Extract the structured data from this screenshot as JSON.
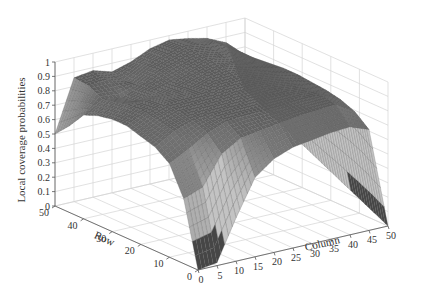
{
  "chart_data": {
    "type": "surface",
    "title": "",
    "xlabel": "Column",
    "ylabel": "Row",
    "zlabel": "Local coverage probabilities",
    "x_ticks": [
      0,
      5,
      10,
      15,
      20,
      25,
      30,
      35,
      40,
      45,
      50
    ],
    "y_ticks": [
      0,
      10,
      20,
      30,
      40,
      50
    ],
    "z_ticks": [
      "0",
      "0.1",
      "0.2",
      "0.3",
      "0.4",
      "0.5",
      "0.6",
      "0.7",
      "0.8",
      "0.9",
      "1"
    ],
    "xlim": [
      0,
      50
    ],
    "ylim": [
      0,
      50
    ],
    "zlim": [
      0,
      1
    ],
    "grid": true,
    "colormap": "gray",
    "grid_rows": [
      0,
      5,
      10,
      15,
      20,
      25,
      30,
      35,
      40,
      45,
      50
    ],
    "grid_cols": [
      0,
      5,
      10,
      15,
      20,
      25,
      30,
      35,
      40,
      45,
      50
    ],
    "z_values": [
      [
        0.0,
        0.02,
        0.3,
        0.55,
        0.65,
        0.7,
        0.72,
        0.74,
        0.75,
        0.7,
        0.0
      ],
      [
        0.45,
        0.5,
        0.7,
        0.78,
        0.8,
        0.82,
        0.84,
        0.85,
        0.86,
        0.78,
        0.05
      ],
      [
        0.65,
        0.72,
        0.8,
        0.85,
        0.86,
        0.86,
        0.87,
        0.88,
        0.88,
        0.82,
        0.1
      ],
      [
        0.72,
        0.8,
        0.84,
        0.86,
        0.87,
        0.88,
        0.89,
        0.89,
        0.88,
        0.84,
        0.15
      ],
      [
        0.75,
        0.82,
        0.86,
        0.87,
        0.88,
        0.9,
        0.91,
        0.9,
        0.88,
        0.85,
        0.2
      ],
      [
        0.78,
        0.84,
        0.87,
        0.88,
        0.89,
        0.91,
        0.92,
        0.91,
        0.89,
        0.86,
        0.25
      ],
      [
        0.78,
        0.84,
        0.86,
        0.86,
        0.88,
        0.92,
        0.94,
        0.92,
        0.89,
        0.86,
        0.3
      ],
      [
        0.76,
        0.82,
        0.8,
        0.84,
        0.88,
        0.93,
        0.96,
        0.93,
        0.89,
        0.85,
        0.35
      ],
      [
        0.72,
        0.8,
        0.78,
        0.84,
        0.9,
        0.94,
        0.97,
        0.95,
        0.9,
        0.84,
        0.4
      ],
      [
        0.6,
        0.85,
        0.86,
        0.82,
        0.9,
        0.95,
        0.98,
        0.96,
        0.92,
        0.84,
        0.45
      ],
      [
        0.5,
        0.86,
        0.88,
        0.84,
        0.88,
        0.94,
        0.97,
        0.95,
        0.92,
        0.86,
        0.5
      ]
    ]
  }
}
